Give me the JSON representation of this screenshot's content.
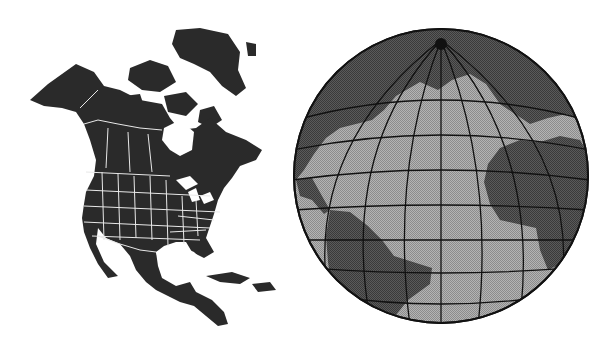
{
  "figures": [
    {
      "id": "north-america-map",
      "description": "Black silhouette map of North America with white state and province borders"
    },
    {
      "id": "atlantic-globe",
      "description": "Globe centered on the Atlantic Ocean with graticule lines; continents dark, ocean light gray"
    }
  ],
  "colors": {
    "land_dark": "#2a2a2a",
    "border_white": "#e8e8e8",
    "ocean_gray": "#a8a8a8",
    "globe_land": "#555555",
    "grid_line": "#111111",
    "background": "#ffffff"
  }
}
